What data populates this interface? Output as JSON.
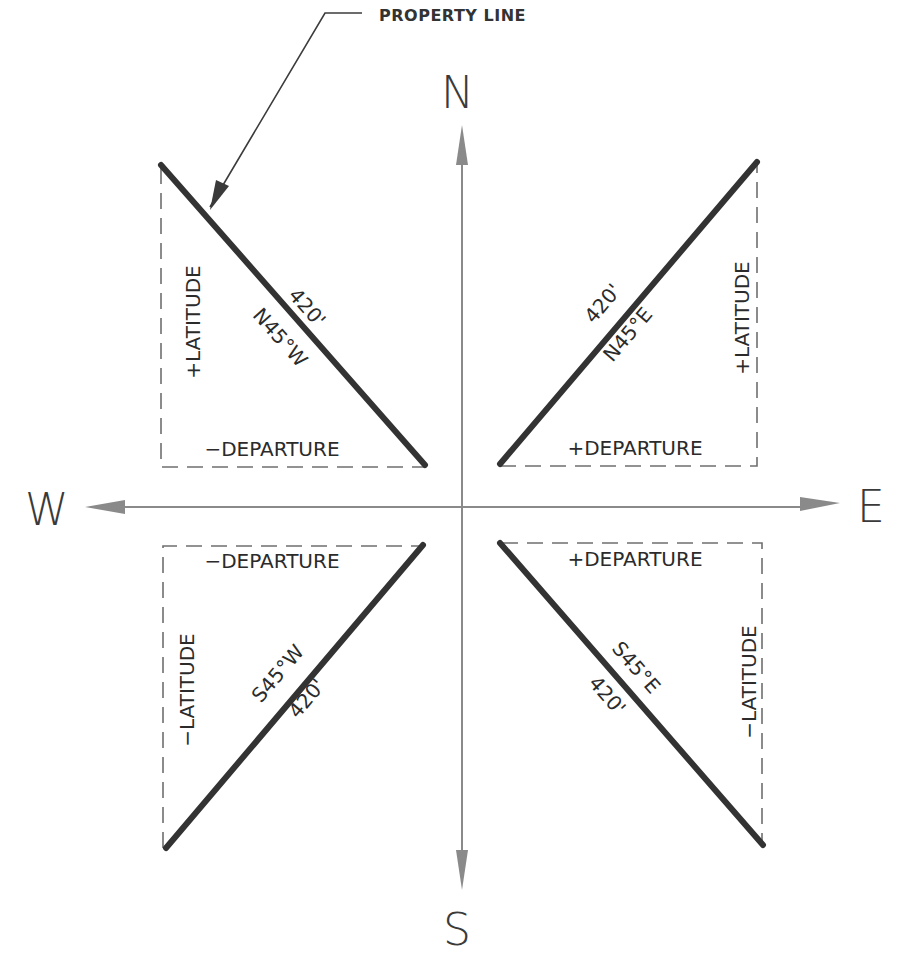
{
  "diagram": {
    "callout": {
      "label": "PROPERTY LINE"
    },
    "cardinals": {
      "north": "N",
      "south": "S",
      "east": "E",
      "west": "W"
    },
    "quadrants": {
      "ne": {
        "bearing": "N45°E",
        "distance": "420'",
        "latitude": "+LATITUDE",
        "departure": "+DEPARTURE"
      },
      "nw": {
        "bearing": "N45°W",
        "distance": "420'",
        "latitude": "+LATITUDE",
        "departure": "−DEPARTURE"
      },
      "sw": {
        "bearing": "S45°W",
        "distance": "420'",
        "latitude": "−LATITUDE",
        "departure": "−DEPARTURE"
      },
      "se": {
        "bearing": "S45°E",
        "distance": "420'",
        "latitude": "−LATITUDE",
        "departure": "+DEPARTURE"
      }
    },
    "colors": {
      "property_line": "#333333",
      "axis": "#8a8a8a",
      "dashed": "#6f6f6f",
      "text": "#2b2b2b"
    }
  }
}
